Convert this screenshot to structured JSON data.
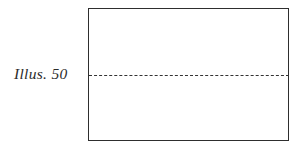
{
  "figure": {
    "caption": "Illus. 50",
    "canvas": {
      "width": 304,
      "height": 149,
      "background_color": "#ffffff"
    },
    "frame": {
      "shape": "rectangle",
      "x": 88,
      "y": 8,
      "width": 201,
      "height": 133,
      "border_color": "#2e2e2e",
      "border_width": 1.5,
      "fill_color": "#ffffff"
    },
    "dashed_line": {
      "orientation": "horizontal",
      "x_start": 89,
      "x_end": 289,
      "y": 75,
      "color": "#333333",
      "stroke_width": 1.6,
      "style": "dashed",
      "dash_count": 21
    },
    "caption_style": {
      "font_style": "italic",
      "font_size": 15.5,
      "color": "#2b2b2b",
      "x": 14,
      "y": 64
    }
  }
}
